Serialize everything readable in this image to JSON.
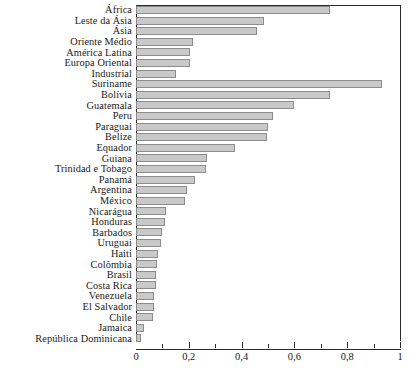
{
  "chart_data": {
    "type": "bar",
    "orientation": "horizontal",
    "title": "",
    "subtitle": "",
    "xlabel": "",
    "ylabel": "",
    "xlim": [
      0,
      1
    ],
    "grid": false,
    "legend": null,
    "decimal_separator": ",",
    "bar_fill_color": "#c9c9c9",
    "bar_border_color": "#8c8c8c",
    "axis_color": "#2b2b2b",
    "background_color": "#ffffff",
    "x_ticks_major": [
      0,
      0.2,
      0.4,
      0.6,
      0.8,
      1
    ],
    "x_tick_labels": [
      "0",
      "0,2",
      "0,4",
      "0,6",
      "0,8",
      "1"
    ],
    "x_ticks_minor": [
      0.1,
      0.3,
      0.5,
      0.7,
      0.9
    ],
    "categories": [
      "África",
      "Leste da Ásia",
      "Ásia",
      "Oriente Médio",
      "América Latina",
      "Europa Oriental",
      "Industrial",
      "Suriname",
      "Bolívia",
      "Guatemala",
      "Peru",
      "Paraguai",
      "Belize",
      "Equador",
      "Guiana",
      "Trinidad e Tobago",
      "Panamá",
      "Argentina",
      "México",
      "Nicarágua",
      "Honduras",
      "Barbados",
      "Uruguai",
      "Haiti",
      "Colômbia",
      "Brasil",
      "Costa Rica",
      "Venezuela",
      "El Salvador",
      "Chile",
      "Jamaica",
      "República Dominicana"
    ],
    "values": [
      0.735,
      0.485,
      0.46,
      0.215,
      0.205,
      0.205,
      0.15,
      0.93,
      0.735,
      0.6,
      0.52,
      0.5,
      0.495,
      0.375,
      0.27,
      0.265,
      0.225,
      0.195,
      0.185,
      0.115,
      0.11,
      0.1,
      0.095,
      0.085,
      0.08,
      0.075,
      0.075,
      0.07,
      0.07,
      0.065,
      0.03,
      0.02
    ]
  }
}
